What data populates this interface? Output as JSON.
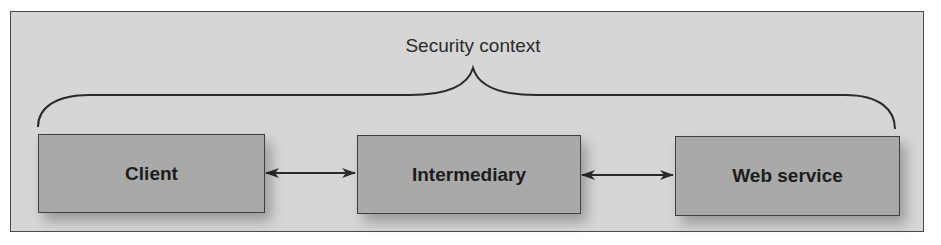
{
  "diagram": {
    "title": "Security context",
    "nodes": [
      {
        "id": "client",
        "label": "Client"
      },
      {
        "id": "intermediary",
        "label": "Intermediary"
      },
      {
        "id": "webservice",
        "label": "Web service"
      }
    ],
    "edges": [
      {
        "from": "client",
        "to": "intermediary",
        "direction": "bidirectional"
      },
      {
        "from": "intermediary",
        "to": "webservice",
        "direction": "bidirectional"
      }
    ],
    "grouping": {
      "type": "curly-brace",
      "label": "Security context",
      "spans": [
        "client",
        "intermediary",
        "webservice"
      ]
    }
  },
  "colors": {
    "frame_background": "#d6d6d6",
    "frame_border": "#4a4a4a",
    "node_fill": "#a9a9a9",
    "node_border": "#3f3f3f",
    "text": "#1c1c1c",
    "line": "#2a2a2a"
  }
}
